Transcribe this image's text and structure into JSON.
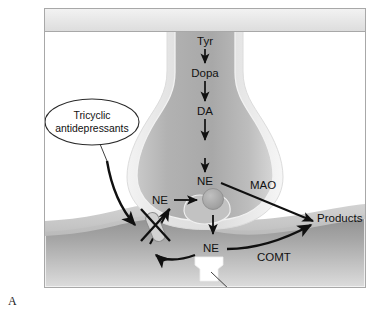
{
  "figure": {
    "panel_letter": "A",
    "title_bar_fill": "#e9e9e9",
    "frame_border_color": "#a8a8a8",
    "background": "#ffffff",
    "ink_color": "#111111"
  },
  "labels": {
    "tyr": "Tyr",
    "dopa": "Dopa",
    "da": "DA",
    "ne_cytosol": "NE",
    "ne_vesicle_src": "NE",
    "ne_cleft": "NE",
    "mao": "MAO",
    "comt": "COMT",
    "products": "Products",
    "receptors": "α and β  adrenergic receptors",
    "drug_line1": "Tricyclic",
    "drug_line2": "antidepressants"
  },
  "diagram_data": {
    "type": "diagram",
    "subject": "Norepinephrine (noradrenergic) nerve terminal synapse",
    "synthesis_pathway": [
      "Tyr",
      "Dopa",
      "DA",
      "NE"
    ],
    "structures": [
      {
        "name": "presynaptic-terminal",
        "description": "bulb-shaped noradrenergic nerve terminal",
        "fill": "#b3b3b3"
      },
      {
        "name": "synaptic-vesicle",
        "description": "storage vesicle inside terminal",
        "fill": "#aaaaaa"
      },
      {
        "name": "synaptic-cleft",
        "description": "gap between terminal and postsynaptic membrane"
      },
      {
        "name": "postsynaptic-cell",
        "description": "postsynaptic effector cell membrane",
        "fill": "#9a9a9a"
      },
      {
        "name": "receptor-block",
        "description": "alpha and beta adrenergic receptor",
        "fill": "#ffffff"
      }
    ],
    "enzymes": [
      "MAO",
      "COMT"
    ],
    "drug": "Tricyclic antidepressants",
    "drug_action": "blocks NE reuptake transporter (shown by X over reuptake arrow)",
    "metabolic_output": "Products",
    "arrows": [
      {
        "from": "Tyr",
        "to": "Dopa",
        "kind": "synthesis"
      },
      {
        "from": "Dopa",
        "to": "DA",
        "kind": "synthesis"
      },
      {
        "from": "DA",
        "to": "NE",
        "kind": "synthesis"
      },
      {
        "from": "NE",
        "to": "MAO/Products",
        "kind": "degradation"
      },
      {
        "from": "NE",
        "to": "vesicle",
        "kind": "storage"
      },
      {
        "from": "vesicle",
        "to": "cleft",
        "kind": "release"
      },
      {
        "from": "cleft NE",
        "to": "terminal",
        "kind": "reuptake-blocked"
      },
      {
        "from": "cleft NE",
        "to": "Products",
        "kind": "COMT degradation"
      },
      {
        "from": "Tricyclic antidepressants",
        "to": "reuptake transporter",
        "kind": "inhibition"
      }
    ]
  }
}
